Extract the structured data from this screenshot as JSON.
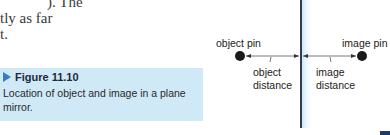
{
  "body_text": {
    "lines": [
      "). The",
      "tly as far",
      "t."
    ]
  },
  "caption": {
    "figure_label": "Figure 11.10",
    "text": "Location of object and image in a plane mirror.",
    "icon": "triangle-pointer-icon",
    "background": "#cfe9f7",
    "accent": "#3b7bc4"
  },
  "figure": {
    "object_label": "object pin",
    "image_label": "image pin",
    "object_distance_label_line1": "object",
    "object_distance_label_line2": "distance",
    "image_distance_label_line1": "image",
    "image_distance_label_line2": "distance",
    "mirror_color": "#2c3e50",
    "mirror_glow": "#cfe9f7"
  }
}
